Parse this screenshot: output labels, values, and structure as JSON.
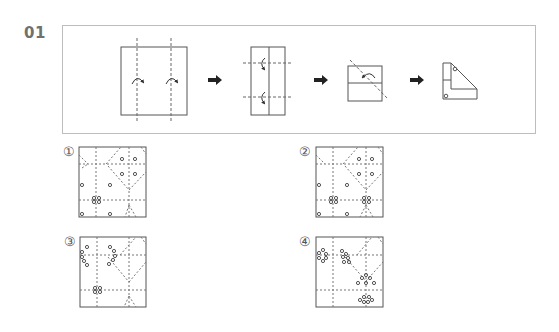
{
  "question": {
    "number": "01",
    "steps": [
      {
        "id": "step-1",
        "description": "square with two vertical valley folds"
      },
      {
        "id": "step-2",
        "description": "folded strip with two horizontal valley folds"
      },
      {
        "id": "step-3",
        "description": "folded square with diagonal fold"
      },
      {
        "id": "step-4",
        "description": "final folded shape with two punched holes"
      }
    ],
    "arrow_glyph": "➡"
  },
  "options": [
    {
      "label": "①",
      "id": "option-1"
    },
    {
      "label": "②",
      "id": "option-2"
    },
    {
      "label": "③",
      "id": "option-3"
    },
    {
      "label": "④",
      "id": "option-4"
    }
  ],
  "colors": {
    "line": "#555555",
    "dash": "#777777",
    "panel_border": "#bdbdbd",
    "number": "#707070"
  }
}
